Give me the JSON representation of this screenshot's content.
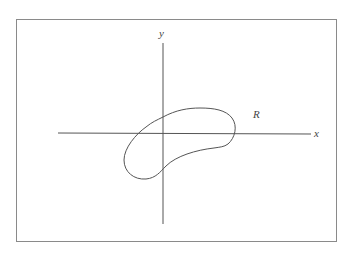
{
  "figure": {
    "axis_labels": {
      "x": "x",
      "y": "y"
    },
    "region_label": "R",
    "colors": {
      "frame": "#8a8a8a",
      "axes": "#555555",
      "curve": "#555555",
      "text": "#444444",
      "background": "#ffffff"
    },
    "elements": [
      {
        "type": "frame",
        "description": "rectangular border around figure"
      },
      {
        "type": "axis",
        "name": "x-axis",
        "direction": "horizontal"
      },
      {
        "type": "axis",
        "name": "y-axis",
        "direction": "vertical"
      },
      {
        "type": "closed-curve",
        "name": "region R",
        "shape": "kidney / bean shaped region straddling the origin, tilted upward to the right"
      }
    ]
  }
}
